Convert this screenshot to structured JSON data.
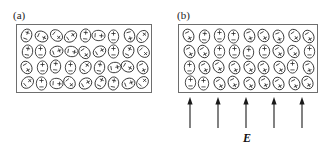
{
  "figure": {
    "type": "physics-diagram",
    "background_color": "#ffffff",
    "box_border_color": "#6e6e6e",
    "dipole_stroke_color": "#2b2b2b",
    "arrow_color": "#1a1a1a",
    "width": 329,
    "height": 153
  },
  "panels": [
    {
      "label": "(a)",
      "label_x": 13,
      "label_y": 9,
      "box": {
        "x": 16,
        "y": 24,
        "w": 136,
        "h": 69
      },
      "state": "unpolarized",
      "rows": 4,
      "cols": 9,
      "dipole_count": 36,
      "has_field": false,
      "angles": [
        20,
        115,
        130,
        55,
        5,
        95,
        0,
        165,
        40,
        10,
        0,
        70,
        100,
        145,
        60,
        0,
        25,
        135,
        150,
        0,
        5,
        0,
        35,
        10,
        80,
        120,
        155,
        50,
        0,
        95,
        140,
        60,
        25,
        10,
        70,
        45
      ]
    },
    {
      "label": "(b)",
      "label_x": 177,
      "label_y": 9,
      "box": {
        "x": 178,
        "y": 24,
        "w": 140,
        "h": 69
      },
      "state": "polarized",
      "rows": 4,
      "cols": 9,
      "dipole_count": 36,
      "has_field": true,
      "angles": [
        155,
        5,
        0,
        0,
        160,
        150,
        160,
        145,
        150,
        155,
        150,
        0,
        0,
        5,
        0,
        150,
        145,
        0,
        0,
        155,
        150,
        155,
        150,
        155,
        150,
        0,
        160,
        0,
        0,
        150,
        155,
        150,
        155,
        150,
        155,
        150
      ]
    }
  ],
  "field": {
    "label": "E",
    "label_x": 243,
    "label_y": 131,
    "direction": "up",
    "arrow_count": 5,
    "arrow_top_y": 97,
    "arrow_bottom_y": 128,
    "arrow_x_positions": [
      190,
      218,
      246,
      274,
      302
    ]
  },
  "dipole": {
    "positive_symbol": "+",
    "negative_symbol": "−"
  }
}
